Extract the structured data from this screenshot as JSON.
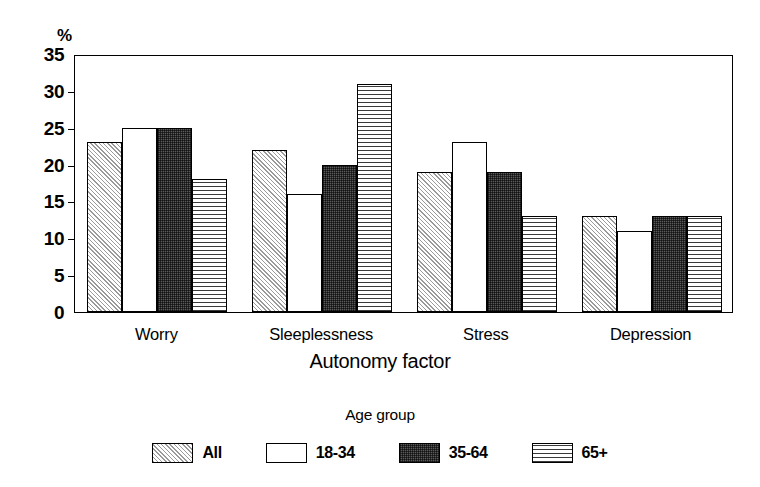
{
  "chart_data": {
    "type": "bar",
    "title": "",
    "xlabel": "Autonomy factor",
    "ylabel": "%",
    "ylim": [
      0,
      35
    ],
    "yticks": [
      0,
      5,
      10,
      15,
      20,
      25,
      30,
      35
    ],
    "grid": false,
    "legend_title": "Age group",
    "legend_position": "bottom",
    "categories": [
      "Worry",
      "Sleeplessness",
      "Stress",
      "Depression"
    ],
    "series": [
      {
        "name": "All",
        "pattern": "diagonal-hatch",
        "values": [
          23,
          22,
          19,
          13
        ]
      },
      {
        "name": "18-34",
        "pattern": "white-empty",
        "values": [
          25,
          16,
          23,
          11
        ]
      },
      {
        "name": "35-64",
        "pattern": "dark-stipple",
        "values": [
          25,
          20,
          19,
          13
        ]
      },
      {
        "name": "65+",
        "pattern": "horizontal-lines",
        "values": [
          18,
          31,
          13,
          13
        ]
      }
    ]
  },
  "axis": {
    "y_unit": "%",
    "y_tick_labels": [
      "35",
      "30",
      "25",
      "20",
      "15",
      "10",
      "5",
      "0"
    ],
    "x_title": "Autonomy factor",
    "x_tick_labels": [
      "Worry",
      "Sleeplessness",
      "Stress",
      "Depression"
    ]
  },
  "legend": {
    "title": "Age group",
    "items": [
      {
        "label": "All"
      },
      {
        "label": "18-34"
      },
      {
        "label": "35-64"
      },
      {
        "label": "65+"
      }
    ]
  },
  "colors": {
    "background": "#ffffff",
    "foreground": "#000000",
    "hatch_fill": "#e3e3e3",
    "dark_fill": "#5a5a5a",
    "white_fill": "#ffffff"
  }
}
